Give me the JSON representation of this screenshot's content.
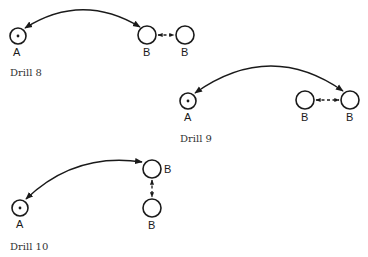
{
  "drills": [
    {
      "caption": "Drill 8",
      "nodes": [
        {
          "label": "A",
          "type": "marked"
        },
        {
          "label": "B",
          "type": "plain"
        },
        {
          "label": "B",
          "type": "plain"
        }
      ],
      "connections": [
        {
          "from": "A",
          "to": "B",
          "style": "solid-curved",
          "arrows": "both"
        },
        {
          "from": "B",
          "to": "B",
          "style": "dashed",
          "arrows": "both"
        }
      ]
    },
    {
      "caption": "Drill 9",
      "nodes": [
        {
          "label": "A",
          "type": "marked"
        },
        {
          "label": "B",
          "type": "plain"
        },
        {
          "label": "B",
          "type": "plain"
        }
      ],
      "connections": [
        {
          "from": "A",
          "to": "B (right)",
          "style": "solid-curved",
          "arrows": "both"
        },
        {
          "from": "B",
          "to": "B",
          "style": "dashed",
          "arrows": "both"
        }
      ]
    },
    {
      "caption": "Drill 10",
      "nodes": [
        {
          "label": "A",
          "type": "marked"
        },
        {
          "label": "B",
          "type": "plain"
        },
        {
          "label": "B",
          "type": "plain"
        }
      ],
      "connections": [
        {
          "from": "A",
          "to": "B (top)",
          "style": "solid-curved",
          "arrows": "both"
        },
        {
          "from": "B (top)",
          "to": "B (bottom)",
          "style": "dashed-vertical",
          "arrows": "both"
        }
      ]
    }
  ]
}
